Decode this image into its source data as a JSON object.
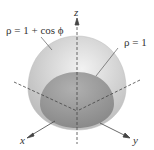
{
  "diagram": {
    "labels": {
      "cardioid_surface": "ρ = 1 + cos ϕ",
      "sphere": "ρ = 1"
    },
    "axes": {
      "x": "x",
      "y": "y",
      "z": "z"
    },
    "colors": {
      "outer_surface": "#d3d3d3",
      "inner_sphere": "#9e9e9e",
      "axis": "#444444"
    }
  }
}
